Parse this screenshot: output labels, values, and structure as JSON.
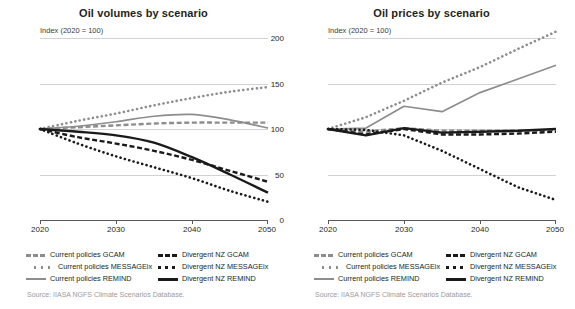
{
  "panels": [
    {
      "key": "volumes",
      "title": "Oil volumes by scenario",
      "axis_note": "Index (2020 = 100)",
      "source": "Source: IIASA NGFS Climate Scenarios Database."
    },
    {
      "key": "prices",
      "title": "Oil prices by scenario",
      "axis_note": "Index (2020 = 100)",
      "source": "Source: IIASA NGFS Climate Scenarios Database."
    }
  ],
  "legend": {
    "rows": [
      {
        "left": {
          "label": "Current policies GCAM",
          "style": "dash",
          "color": "#8d8d8d"
        },
        "right": {
          "label": "Divergent NZ GCAM",
          "style": "dash",
          "color": "#1a1a1a"
        }
      },
      {
        "left": {
          "label": "Current policies MESSAGEix",
          "style": "dot",
          "color": "#8d8d8d"
        },
        "right": {
          "label": "Divergent NZ MESSAGEix",
          "style": "dot",
          "color": "#1a1a1a"
        }
      },
      {
        "left": {
          "label": "Current policies REMIND",
          "style": "solid",
          "color": "#8d8d8d"
        },
        "right": {
          "label": "Divergent NZ REMIND",
          "style": "solid",
          "color": "#1a1a1a"
        }
      }
    ]
  },
  "axes": {
    "yticks": [
      "200",
      "150",
      "100",
      "50",
      "0"
    ],
    "ytick_values": [
      200,
      150,
      100,
      50,
      0
    ],
    "xticks": [
      "2020",
      "2030",
      "2040",
      "2050"
    ],
    "xtick_values": [
      2020,
      2030,
      2040,
      2050
    ],
    "ylim": [
      0,
      200
    ],
    "xlim": [
      2020,
      2050
    ]
  },
  "colors": {
    "current_policies": "#8d8d8d",
    "divergent_nz": "#1a1a1a",
    "gridline": "#d2d2d2",
    "axis": "#5a5a5a",
    "text": "#231f20",
    "source_text": "#9b9b9b"
  },
  "chart_data": [
    {
      "type": "line",
      "title": "Oil volumes by scenario",
      "xlabel": "",
      "ylabel": "Index (2020 = 100)",
      "xlim": [
        2020,
        2050
      ],
      "ylim": [
        0,
        200
      ],
      "grid": true,
      "legend_position": "below",
      "x": [
        2020,
        2025,
        2030,
        2035,
        2040,
        2045,
        2050
      ],
      "series": [
        {
          "name": "Current policies GCAM",
          "style": "dash",
          "color": "#8d8d8d",
          "values": [
            100,
            102,
            104,
            106,
            107,
            107,
            107
          ]
        },
        {
          "name": "Current policies MESSAGEix",
          "style": "dot",
          "color": "#8d8d8d",
          "values": [
            100,
            109,
            117,
            126,
            134,
            141,
            146
          ]
        },
        {
          "name": "Current policies REMIND",
          "style": "solid",
          "color": "#8d8d8d",
          "values": [
            100,
            103,
            108,
            114,
            116,
            110,
            101
          ]
        },
        {
          "name": "Divergent NZ GCAM",
          "style": "dash",
          "color": "#1a1a1a",
          "values": [
            100,
            91,
            84,
            76,
            66,
            54,
            42
          ]
        },
        {
          "name": "Divergent NZ MESSAGEix",
          "style": "dot",
          "color": "#1a1a1a",
          "values": [
            100,
            84,
            70,
            58,
            46,
            32,
            20
          ]
        },
        {
          "name": "Divergent NZ REMIND",
          "style": "solid",
          "color": "#1a1a1a",
          "values": [
            100,
            97,
            93,
            85,
            69,
            50,
            30
          ]
        }
      ]
    },
    {
      "type": "line",
      "title": "Oil prices by scenario",
      "xlabel": "",
      "ylabel": "Index (2020 = 100)",
      "xlim": [
        2020,
        2050
      ],
      "ylim": [
        0,
        200
      ],
      "grid": true,
      "legend_position": "below",
      "x": [
        2020,
        2025,
        2030,
        2035,
        2040,
        2045,
        2050
      ],
      "series": [
        {
          "name": "Current policies GCAM",
          "style": "dash",
          "color": "#8d8d8d",
          "values": [
            100,
            97,
            101,
            98,
            98,
            98,
            99
          ]
        },
        {
          "name": "Current policies MESSAGEix",
          "style": "dot",
          "color": "#8d8d8d",
          "values": [
            100,
            113,
            131,
            151,
            168,
            188,
            207
          ]
        },
        {
          "name": "Current policies REMIND",
          "style": "solid",
          "color": "#8d8d8d",
          "values": [
            100,
            101,
            125,
            119,
            140,
            155,
            170
          ]
        },
        {
          "name": "Divergent NZ GCAM",
          "style": "dash",
          "color": "#1a1a1a",
          "values": [
            100,
            94,
            100,
            94,
            94,
            95,
            97
          ]
        },
        {
          "name": "Divergent NZ MESSAGEix",
          "style": "dot",
          "color": "#1a1a1a",
          "values": [
            100,
            99,
            93,
            76,
            56,
            36,
            22
          ]
        },
        {
          "name": "Divergent NZ REMIND",
          "style": "solid",
          "color": "#1a1a1a",
          "values": [
            100,
            93,
            101,
            96,
            97,
            98,
            100
          ]
        }
      ]
    }
  ]
}
